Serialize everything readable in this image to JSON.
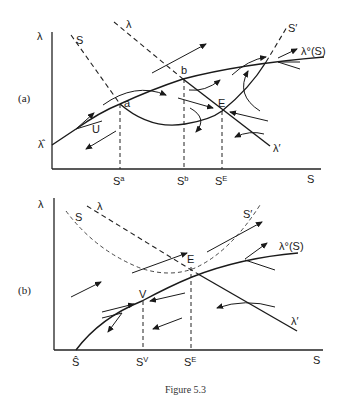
{
  "figure": {
    "caption": "Figure 5.3",
    "panels": [
      {
        "id": "a",
        "panel_label": "(a)",
        "y_axis_label": "λ",
        "x_axis_label": "S",
        "y_intercept_label": "λ̂",
        "curves": {
          "lambda_o": "λ°(S)",
          "s_left": "S",
          "s_right": "S′",
          "lambda_left": "λ",
          "lambda_right": "λ′"
        },
        "points": {
          "a": "a",
          "b": "b",
          "E": "E",
          "U": "U"
        },
        "x_ticks": [
          {
            "base": "S",
            "sup": "a"
          },
          {
            "base": "S",
            "sup": "b"
          },
          {
            "base": "S",
            "sup": "E"
          }
        ]
      },
      {
        "id": "b",
        "panel_label": "(b)",
        "y_axis_label": "λ",
        "x_axis_label": "S",
        "x_intercept_label": "Ŝ",
        "curves": {
          "lambda_o": "λ°(S)",
          "s_left": "S",
          "s_right": "S′",
          "lambda_left": "λ",
          "lambda_right": "λ′"
        },
        "points": {
          "V": "V",
          "E": "E"
        },
        "x_ticks": [
          {
            "base": "S",
            "sup": "V"
          },
          {
            "base": "S",
            "sup": "E"
          }
        ]
      }
    ]
  }
}
